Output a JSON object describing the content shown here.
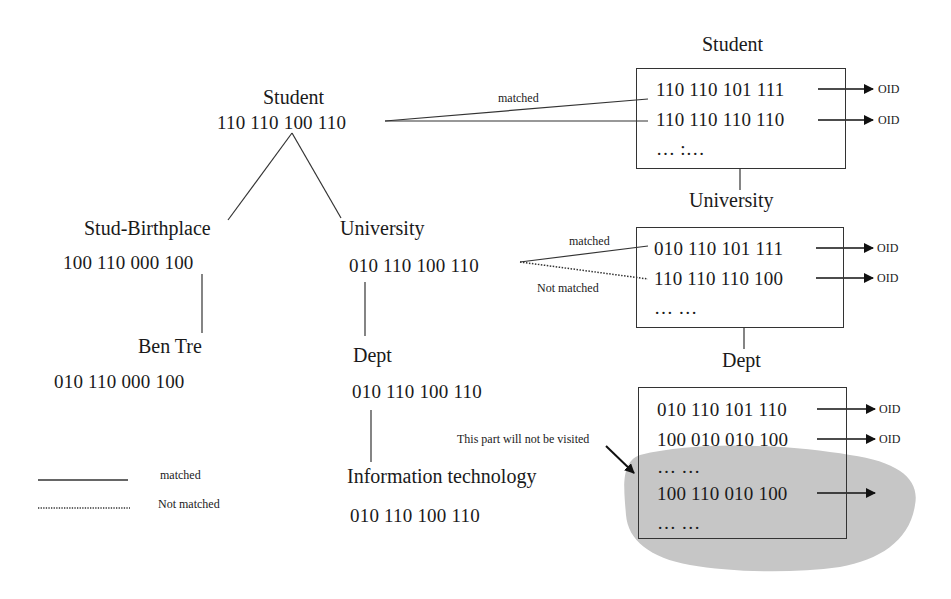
{
  "tree": {
    "root": {
      "label": "Student",
      "code": "110 110 100 110"
    },
    "left": {
      "label": "Stud-Birthplace",
      "code": "100 110 000 100"
    },
    "left_child": {
      "label": "Ben Tre",
      "code": "010 110 000 100"
    },
    "right": {
      "label": "University",
      "code": "010 110 100 110"
    },
    "right_child": {
      "label": "Dept",
      "code": "010 110 100 110"
    },
    "right_grandchild": {
      "label": "Information technology",
      "code": "010 110 100 110"
    }
  },
  "edges": {
    "root_match_label": "matched",
    "univ_match_label": "matched",
    "univ_not_match_label": "Not matched"
  },
  "index": {
    "student": {
      "title": "Student",
      "rows": [
        "110 110 101 111",
        "110 110 110 110"
      ],
      "ellipsis": "… :…",
      "pointer": "OID"
    },
    "university": {
      "title": "University",
      "rows": [
        "010 110 101 111",
        "110 110 110 100"
      ],
      "ellipsis": "… …",
      "pointer": "OID"
    },
    "dept": {
      "title": "Dept",
      "rows": [
        "010 110 101 110",
        "100 010 010 100"
      ],
      "ellipsis1": "… …",
      "hidden_row": "100 110 010 100",
      "ellipsis2": "… …",
      "pointer": "OID"
    }
  },
  "annotation": {
    "not_visited": "This part will not be visited"
  },
  "legend": {
    "solid_label": "matched",
    "dotted_label": "Not matched"
  },
  "colors": {
    "line": "#333333",
    "blob": "#c8c8c8",
    "text": "#1a1a1a"
  }
}
